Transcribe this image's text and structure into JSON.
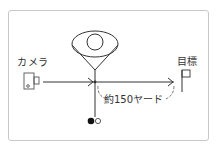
{
  "diagram": {
    "type": "golf-alignment-camera-diagram",
    "labels": {
      "camera": "カメラ",
      "target": "目標",
      "distance": "約150ヤード"
    },
    "nodes": [
      {
        "id": "camera",
        "label": "カメラ",
        "icon": "camera-icon"
      },
      {
        "id": "golfer",
        "label": "",
        "icon": "golfer-top-view-icon"
      },
      {
        "id": "ball",
        "label": "",
        "icon": "golf-ball-icon"
      },
      {
        "id": "target",
        "label": "目標",
        "icon": "flag-icon"
      }
    ],
    "edges": [
      {
        "from": "camera",
        "to": "golfer",
        "style": "arrow"
      },
      {
        "from": "golfer",
        "to": "target",
        "style": "arrow",
        "label": "約150ヤード"
      },
      {
        "from": "golfer",
        "to": "ball",
        "style": "line"
      }
    ],
    "colors": {
      "line": "#333333",
      "frame": "#c8c8c8",
      "icon_outline": "#555555",
      "background": "#ffffff"
    }
  }
}
